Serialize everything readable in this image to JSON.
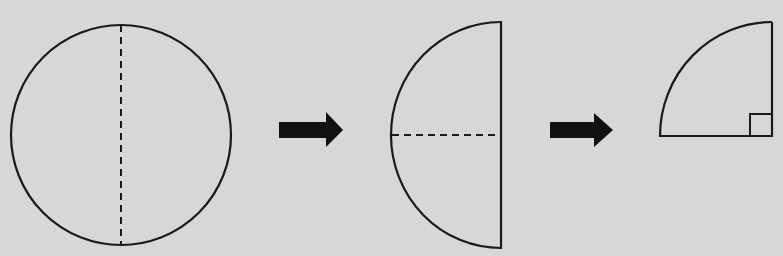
{
  "diagram": {
    "title_fragment": "",
    "steps": [
      {
        "id": "step-1",
        "shape": "circle",
        "fold_line": "vertical dashed diameter"
      },
      {
        "id": "step-2",
        "shape": "semicircle",
        "fold_line": "horizontal dashed radius"
      },
      {
        "id": "step-3",
        "shape": "quarter-circle",
        "marker": "right-angle square"
      }
    ],
    "arrows": [
      {
        "id": "arrow-1",
        "direction": "right"
      },
      {
        "id": "arrow-2",
        "direction": "right"
      }
    ],
    "colors": {
      "background": "#d7d7d7",
      "stroke": "#1a1a1a"
    }
  }
}
